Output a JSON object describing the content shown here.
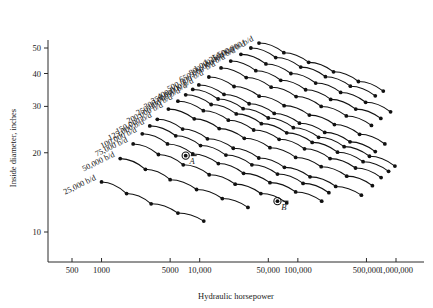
{
  "chart_data": {
    "type": "line",
    "title": "",
    "xlabel": "Hydraulic horsepower",
    "ylabel": "Inside diameter, inches",
    "xscale": "log",
    "yscale": "log",
    "xlim": [
      500,
      1000000
    ],
    "ylim": [
      7,
      55
    ],
    "grid": false,
    "legend_position": "inline-curve-labels",
    "xticks": [
      {
        "value": 500,
        "label": "500"
      },
      {
        "value": 1000,
        "label": "1000"
      },
      {
        "value": 5000,
        "label": "5000"
      },
      {
        "value": 10000,
        "label": "10,000"
      },
      {
        "value": 50000,
        "label": "50,000"
      },
      {
        "value": 100000,
        "label": "100,000"
      },
      {
        "value": 500000,
        "label": "500,000"
      },
      {
        "value": 1000000,
        "label": "1,000,000"
      }
    ],
    "yticks": [
      {
        "value": 10,
        "label": "10"
      },
      {
        "value": 20,
        "label": "20"
      },
      {
        "value": 30,
        "label": "30"
      },
      {
        "value": 40,
        "label": "40"
      },
      {
        "value": 50,
        "label": "50"
      }
    ],
    "series": [
      {
        "name": "25,000 b/d",
        "label": "25,000 b/d",
        "x": [
          1000,
          1800,
          3200,
          6000,
          11000
        ],
        "y": [
          15.5,
          14.0,
          12.8,
          11.8,
          11.0
        ]
      },
      {
        "name": "50,000 b/d",
        "label": "50,000 b/d",
        "x": [
          1550,
          2800,
          5000,
          9300,
          17000,
          31000
        ],
        "y": [
          19.0,
          17.3,
          15.8,
          14.5,
          13.4,
          12.4
        ]
      },
      {
        "name": "75,000 b/d",
        "label": "75,000 b/d",
        "x": [
          2100,
          3800,
          6800,
          12500,
          23000,
          42000,
          77000
        ],
        "y": [
          21.6,
          19.7,
          18.0,
          16.5,
          15.2,
          14.0,
          12.9
        ]
      },
      {
        "name": "100,000 b/d",
        "label": "100,000 b/d",
        "x": [
          2600,
          4700,
          8500,
          15500,
          28000,
          52000,
          95000,
          175000
        ],
        "y": [
          23.6,
          21.6,
          19.8,
          18.2,
          16.7,
          15.4,
          14.2,
          13.1
        ]
      },
      {
        "name": "125,000 b/d",
        "label": "125,000 b/d",
        "x": [
          3100,
          5700,
          10200,
          18500,
          34000,
          62000,
          113000,
          207000
        ],
        "y": [
          25.3,
          23.2,
          21.3,
          19.6,
          18.0,
          16.6,
          15.3,
          14.1
        ]
      },
      {
        "name": "150,000 b/d",
        "label": "150,000 b/d",
        "x": [
          3700,
          6700,
          12000,
          22000,
          40000,
          73000,
          133000,
          243000,
          444000
        ],
        "y": [
          26.8,
          24.6,
          22.6,
          20.8,
          19.1,
          17.6,
          16.2,
          14.9,
          13.8
        ]
      },
      {
        "name": "200,000 b/d",
        "label": "200,000 b/d",
        "x": [
          4800,
          8800,
          15800,
          28500,
          52000,
          95000,
          173000,
          315000,
          575000
        ],
        "y": [
          29.3,
          26.9,
          24.7,
          22.7,
          20.9,
          19.2,
          17.7,
          16.3,
          15.0
        ]
      },
      {
        "name": "250,000 b/d",
        "label": "250,000 b/d",
        "x": [
          6000,
          10900,
          19600,
          35500,
          64500,
          117000,
          213000,
          387000,
          705000
        ],
        "y": [
          31.4,
          28.9,
          26.6,
          24.4,
          22.5,
          20.7,
          19.0,
          17.5,
          16.1
        ]
      },
      {
        "name": "300,000 b/d",
        "label": "300,000 b/d",
        "x": [
          7200,
          13100,
          23600,
          42500,
          77000,
          140000,
          254000,
          462000,
          840000
        ],
        "y": [
          33.2,
          30.5,
          28.1,
          25.8,
          23.8,
          21.9,
          20.1,
          18.5,
          17.0
        ]
      },
      {
        "name": "350,000 b/d",
        "label": "350,000 b/d",
        "x": [
          8500,
          15400,
          27700,
          50000,
          90000,
          163000,
          296000,
          537000,
          975000
        ],
        "y": [
          34.8,
          32.0,
          29.4,
          27.1,
          24.9,
          22.9,
          21.1,
          19.4,
          17.8
        ]
      },
      {
        "name": "400,000 b/d",
        "label": "400,000 b/d",
        "x": [
          9800,
          17700,
          31900,
          57500,
          104000,
          188000,
          340000,
          615000
        ],
        "y": [
          36.2,
          33.3,
          30.7,
          28.2,
          25.9,
          23.9,
          22.0,
          20.2
        ]
      },
      {
        "name": "500,000 b/d",
        "label": "500,000 b/d",
        "x": [
          12400,
          22400,
          40400,
          72500,
          131000,
          236000,
          426000,
          770000
        ],
        "y": [
          38.8,
          35.7,
          32.8,
          30.2,
          27.8,
          25.6,
          23.5,
          21.6
        ]
      },
      {
        "name": "650,000 b/d",
        "label": "650,000 b/d",
        "x": [
          16500,
          29800,
          53500,
          96000,
          173000,
          312000,
          562000
        ],
        "y": [
          42.0,
          38.6,
          35.5,
          32.7,
          30.0,
          27.6,
          25.4
        ]
      },
      {
        "name": "800,000 b/d",
        "label": "800,000 b/d",
        "x": [
          20700,
          37300,
          67000,
          120000,
          216000,
          389000,
          700000
        ],
        "y": [
          44.6,
          41.0,
          37.7,
          34.7,
          31.9,
          29.3,
          27.0
        ]
      },
      {
        "name": "1,000,000 b/d",
        "label": "1,000,000 b/d",
        "x": [
          26300,
          47300,
          85000,
          152000,
          273000,
          491000,
          880000
        ],
        "y": [
          47.3,
          43.5,
          40.0,
          36.8,
          33.9,
          31.1,
          28.6
        ]
      },
      {
        "name": "1,250,000 b/d",
        "label": "1,250,000 b/d",
        "x": [
          33200,
          59500,
          107000,
          191000,
          343000,
          615000
        ],
        "y": [
          50.0,
          46.0,
          42.3,
          38.9,
          35.8,
          32.9
        ]
      },
      {
        "name": "1,500,000 b/d",
        "label": "1,500,000 b/d",
        "x": [
          40200,
          72000,
          129000,
          231000,
          414000,
          742000
        ],
        "y": [
          52.2,
          48.0,
          44.1,
          40.6,
          37.3,
          34.3
        ]
      }
    ],
    "annotations": [
      {
        "label": "A",
        "x": 7200,
        "y": 19.5,
        "style": "circled-point"
      },
      {
        "label": "B",
        "x": 62000,
        "y": 13.1,
        "style": "circled-point"
      }
    ]
  }
}
